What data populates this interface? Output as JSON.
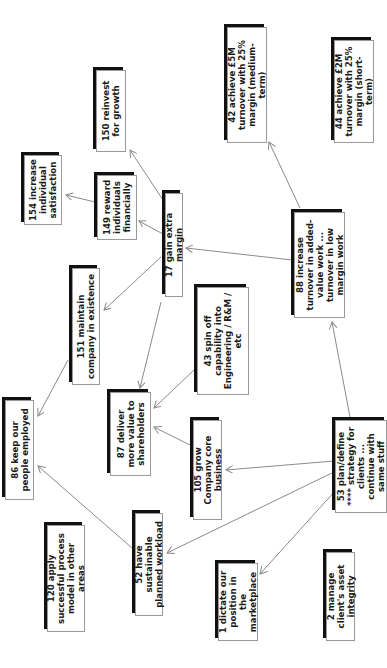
{
  "diagram": {
    "orientation": "rotated-90-ccw",
    "colors": {
      "box_border": "#9a9a9a",
      "box_shadow": "#111111",
      "arrow": "#8a8a8a",
      "text": "#1a1a1a"
    },
    "nodes": [
      {
        "id": "150",
        "label": "150 reinvest for growth",
        "x": 96,
        "y": 70,
        "w": 30,
        "h": 82
      },
      {
        "id": "154",
        "label": "154 increase individual satisfaction",
        "x": 24,
        "y": 155,
        "w": 38,
        "h": 70
      },
      {
        "id": "149",
        "label": "149 reward individuals financially",
        "x": 97,
        "y": 175,
        "w": 40,
        "h": 65
      },
      {
        "id": "17",
        "label": "17 gain extra margin",
        "x": 165,
        "y": 193,
        "w": 18,
        "h": 104
      },
      {
        "id": "42",
        "label": "42 achieve £5M turnover with 25% margin (medium-term)",
        "x": 227,
        "y": 27,
        "w": 40,
        "h": 116
      },
      {
        "id": "44",
        "label": "44 achieve £2M turnover with 25% margin (short-term)",
        "x": 334,
        "y": 40,
        "w": 40,
        "h": 103
      },
      {
        "id": "151",
        "label": "151 maintain company in existence",
        "x": 72,
        "y": 268,
        "w": 28,
        "h": 117
      },
      {
        "id": "88",
        "label": "88 increase turnover in added-value work ... turnover in low margin work",
        "x": 294,
        "y": 212,
        "w": 51,
        "h": 106
      },
      {
        "id": "43",
        "label": "43 spin off capability into Engineering / R&M / etc",
        "x": 197,
        "y": 287,
        "w": 52,
        "h": 108
      },
      {
        "id": "87",
        "label": "87 deliver more value to shareholders",
        "x": 110,
        "y": 392,
        "w": 41,
        "h": 84
      },
      {
        "id": "86",
        "label": "86 keep our people employed",
        "x": 5,
        "y": 400,
        "w": 29,
        "h": 100
      },
      {
        "id": "105",
        "label": "105 grow Company core business",
        "x": 193,
        "y": 420,
        "w": 29,
        "h": 100
      },
      {
        "id": "52",
        "label": "52 have sustainable planned workload",
        "x": 135,
        "y": 513,
        "w": 28,
        "h": 103
      },
      {
        "id": "120",
        "label": "120 apply successful process model in other areas",
        "x": 47,
        "y": 525,
        "w": 38,
        "h": 107
      },
      {
        "id": "53",
        "label": "53 plan/define **** strategy for clients ... continue with same stuff",
        "x": 335,
        "y": 420,
        "w": 52,
        "h": 93
      },
      {
        "id": "1",
        "label": "1 dictate our position in the marketplace",
        "x": 218,
        "y": 563,
        "w": 40,
        "h": 78
      },
      {
        "id": "2",
        "label": "2 manage client's asset integrity",
        "x": 326,
        "y": 552,
        "w": 29,
        "h": 89
      }
    ],
    "edges": [
      {
        "from": "17",
        "to": "150",
        "x1": 163,
        "y1": 200,
        "x2": 130,
        "y2": 150
      },
      {
        "from": "17",
        "to": "149",
        "x1": 163,
        "y1": 234,
        "x2": 139,
        "y2": 221
      },
      {
        "from": "149",
        "to": "154",
        "x1": 95,
        "y1": 202,
        "x2": 66,
        "y2": 195
      },
      {
        "from": "17",
        "to": "151",
        "x1": 161,
        "y1": 257,
        "x2": 104,
        "y2": 310
      },
      {
        "from": "17",
        "to": "87",
        "x1": 161,
        "y1": 302,
        "x2": 140,
        "y2": 388
      },
      {
        "from": "88",
        "to": "17",
        "x1": 292,
        "y1": 260,
        "x2": 186,
        "y2": 248
      },
      {
        "from": "88",
        "to": "42",
        "x1": 300,
        "y1": 208,
        "x2": 269,
        "y2": 142
      },
      {
        "from": "43",
        "to": "87",
        "x1": 194,
        "y1": 370,
        "x2": 154,
        "y2": 408
      },
      {
        "from": "105",
        "to": "87",
        "x1": 190,
        "y1": 445,
        "x2": 154,
        "y2": 427
      },
      {
        "from": "151",
        "to": "86",
        "x1": 68,
        "y1": 360,
        "x2": 38,
        "y2": 416
      },
      {
        "from": "52",
        "to": "86",
        "x1": 132,
        "y1": 548,
        "x2": 38,
        "y2": 466
      },
      {
        "from": "53",
        "to": "88",
        "x1": 350,
        "y1": 417,
        "x2": 332,
        "y2": 322
      },
      {
        "from": "53",
        "to": "105",
        "x1": 334,
        "y1": 461,
        "x2": 226,
        "y2": 470
      },
      {
        "from": "53",
        "to": "52",
        "x1": 334,
        "y1": 472,
        "x2": 167,
        "y2": 553
      },
      {
        "from": "53",
        "to": "1",
        "x1": 336,
        "y1": 490,
        "x2": 260,
        "y2": 574
      }
    ]
  }
}
